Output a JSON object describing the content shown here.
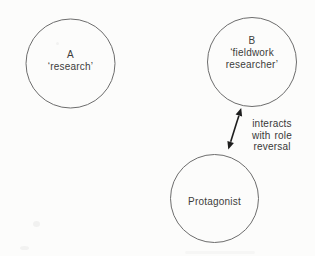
{
  "diagram": {
    "nodes": {
      "a": {
        "title": "A",
        "subtitle": "‘research’"
      },
      "b": {
        "title": "B",
        "subtitle": "‘fieldwork\nresearcher’"
      },
      "protagonist": {
        "title": "Protagonist"
      }
    },
    "arrow": {
      "label": "interacts\nwith role\nreversal",
      "type": "double-headed"
    },
    "colors": {
      "background": "#fcfcfb",
      "circle_stroke": "#6d6d6d",
      "text": "#3c3c3c",
      "arrow": "#1e1e1e"
    }
  }
}
